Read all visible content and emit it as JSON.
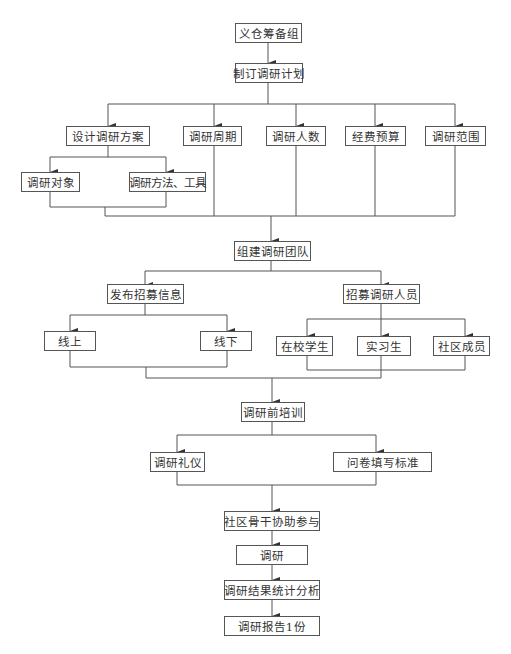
{
  "flowchart": {
    "nodes": {
      "n1": "义仓筹备组",
      "n2": "制订调研计划",
      "n3": "设计调研方案",
      "n4": "调研周期",
      "n5": "调研人数",
      "n6": "经费预算",
      "n7": "调研范围",
      "n8": "调研对象",
      "n9": "调研方法、工具",
      "n10": "组建调研团队",
      "n11": "发布招募信息",
      "n12": "招募调研人员",
      "n13": "线上",
      "n14": "线下",
      "n15": "在校学生",
      "n16": "实习生",
      "n17": "社区成员",
      "n18": "调研前培训",
      "n19": "调研礼仪",
      "n20": "问卷填写标准",
      "n21": "社区骨干协助参与",
      "n22": "调研",
      "n23": "调研结果统计分析",
      "n24": "调研报告1份"
    },
    "colors": {
      "line": "#555555",
      "text": "#333333",
      "background": "#ffffff"
    }
  }
}
